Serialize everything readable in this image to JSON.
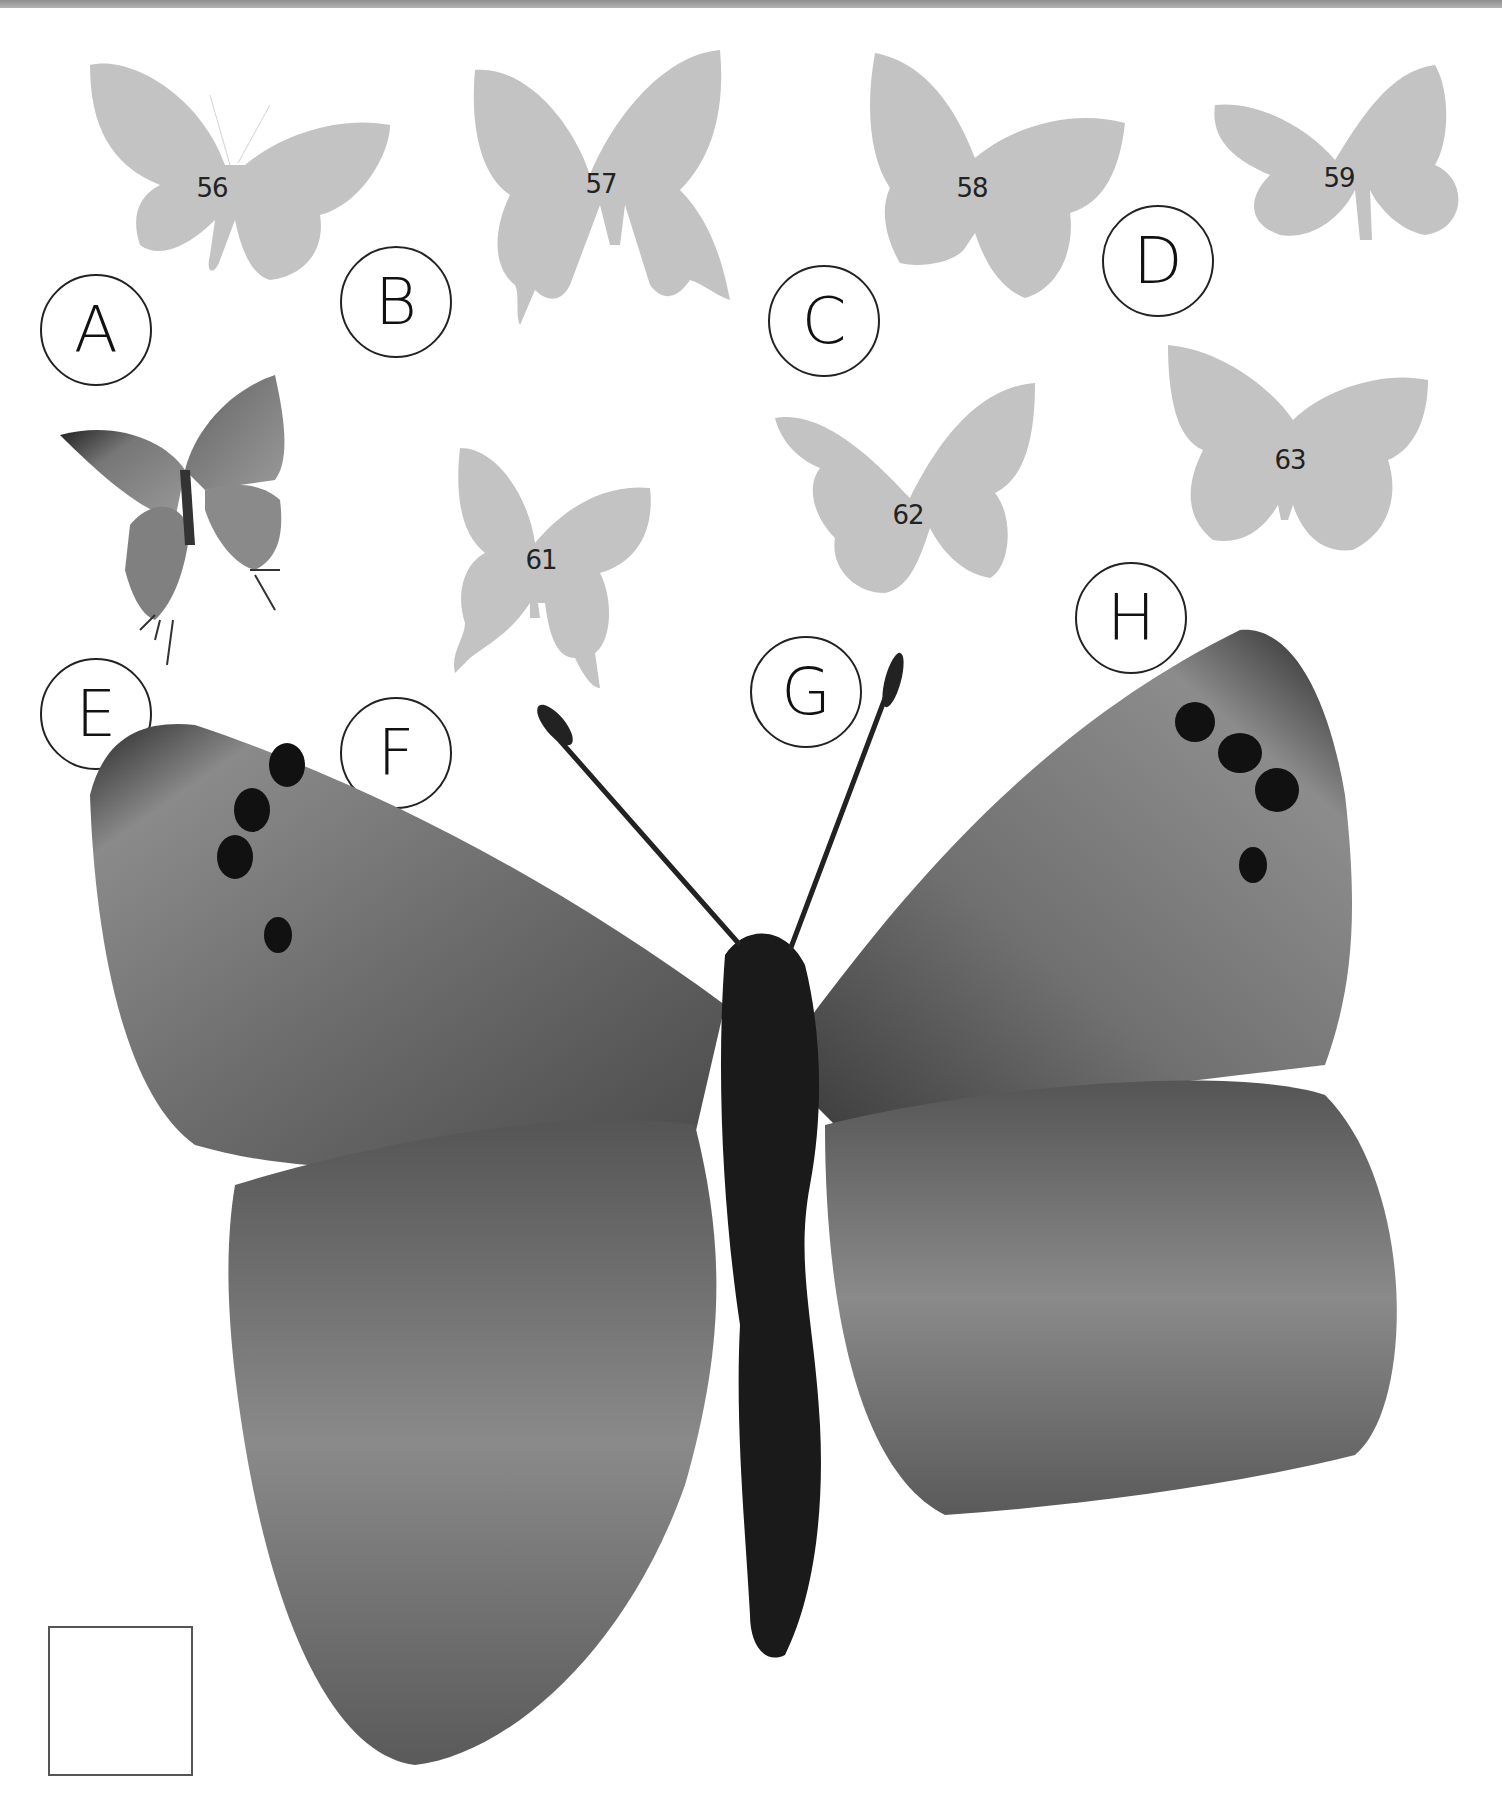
{
  "page": {
    "background": "#ffffff",
    "silhouette_color": "#c3c3c3",
    "label_circle_color": "#222222"
  },
  "silhouettes": [
    {
      "number": "56",
      "shape": "birdwing"
    },
    {
      "number": "57",
      "shape": "swallowtail"
    },
    {
      "number": "58",
      "shape": "broadwing"
    },
    {
      "number": "59",
      "shape": "small"
    },
    {
      "number": "61",
      "shape": "swallowtail"
    },
    {
      "number": "62",
      "shape": "broadwing"
    },
    {
      "number": "63",
      "shape": "broadwing"
    }
  ],
  "letters": [
    "A",
    "B",
    "C",
    "D",
    "E",
    "F",
    "G",
    "H"
  ],
  "photos": {
    "small_butterfly": "hairstreak-butterfly-photo",
    "large_butterfly": "blue-butterfly-closeup-photo"
  },
  "answer_box": {
    "value": ""
  }
}
